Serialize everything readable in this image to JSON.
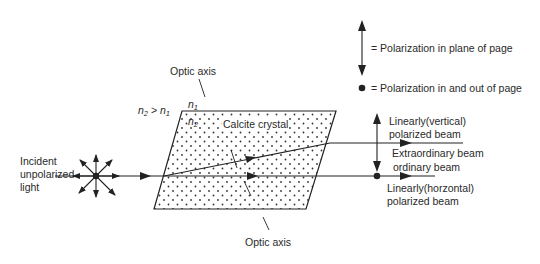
{
  "diagram": {
    "legend": {
      "plane_label": "= Polarization in plane of page",
      "out_label": "= Polarization in and out of page"
    },
    "labels": {
      "optic_axis_top": "Optic axis",
      "optic_axis_bottom": "Optic axis",
      "n1": "n",
      "n1_sub": "1",
      "n2_inner": "n",
      "n2_inner_sub": "2",
      "index_rel_n2": "n",
      "index_rel_n2_sub": "2",
      "index_rel_gt": " > ",
      "index_rel_n1": "n",
      "index_rel_n1_sub": "1",
      "crystal": "Calcite crystal",
      "incident_line1": "Incident",
      "incident_line2": "unpolarized",
      "incident_line3": "light",
      "vertical_line1": "Linearly(vertical)",
      "vertical_line2": "polarized beam",
      "extraordinary": "Extraordinary beam",
      "ordinary": "ordinary beam",
      "horizontal_line1": "Linearly(horzontal)",
      "horizontal_line2": "polarized beam"
    },
    "colors": {
      "line": "#222222",
      "dots": "#333333",
      "background": "#ffffff"
    }
  }
}
